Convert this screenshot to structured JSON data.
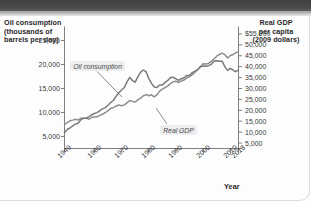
{
  "figure": {
    "left_axis_title": "Oil consumption (thousands of barrels per day)",
    "right_axis_title": "Real GDP per capita (2009 dollars)",
    "xaxis_title": "Year"
  },
  "chart_data": {
    "type": "line",
    "title": "",
    "xlabel": "Year",
    "grid": false,
    "legend": "inline-annotations",
    "x": [
      1949,
      1950,
      1951,
      1952,
      1953,
      1954,
      1955,
      1956,
      1957,
      1958,
      1959,
      1960,
      1961,
      1962,
      1963,
      1964,
      1965,
      1966,
      1967,
      1968,
      1969,
      1970,
      1971,
      1972,
      1973,
      1974,
      1975,
      1976,
      1977,
      1978,
      1979,
      1980,
      1981,
      1982,
      1983,
      1984,
      1985,
      1986,
      1987,
      1988,
      1989,
      1990,
      1991,
      1992,
      1993,
      1994,
      1995,
      1996,
      1997,
      1998,
      1999,
      2000,
      2001,
      2002,
      2003,
      2004,
      2005,
      2006,
      2007,
      2008,
      2009,
      2010,
      2011,
      2012,
      2013
    ],
    "xticks": [
      "1949",
      "1960",
      "1970",
      "1980",
      "1990",
      "2000",
      "2010",
      "2013"
    ],
    "xtick_values": [
      1949,
      1960,
      1970,
      1980,
      1990,
      2000,
      2010,
      2013
    ],
    "axes": [
      {
        "id": "left",
        "side": "left",
        "label": "Oil consumption (thousands of barrels per day)",
        "ticks": [
          "25,000",
          "20,000",
          "15,000",
          "10,000",
          "5,000"
        ],
        "tick_values": [
          25000,
          20000,
          15000,
          10000,
          5000
        ],
        "ylim": [
          2500,
          27500
        ]
      },
      {
        "id": "right",
        "side": "right",
        "label": "Real GDP per capita (2009 dollars)",
        "ticks": [
          "$55,000",
          "50,000",
          "45,000",
          "40,000",
          "35,000",
          "30,000",
          "25,000",
          "20,000",
          "15,000",
          "10,000",
          "5,000"
        ],
        "tick_values": [
          55000,
          50000,
          45000,
          40000,
          35000,
          30000,
          25000,
          20000,
          15000,
          10000,
          5000
        ],
        "ylim": [
          2500,
          57500
        ]
      }
    ],
    "series": [
      {
        "name": "Oil consumption",
        "axis": "left",
        "units": "thousands of barrels per day",
        "color": "#7a7a7c",
        "annotation": "Oil consumption",
        "values": [
          5770,
          6458,
          6765,
          7200,
          7570,
          7760,
          8460,
          8780,
          8800,
          9120,
          9530,
          9800,
          9980,
          10400,
          10740,
          11020,
          11510,
          12080,
          12560,
          13390,
          14140,
          14700,
          15210,
          16370,
          17310,
          16650,
          16320,
          17460,
          18430,
          18850,
          18510,
          17060,
          16060,
          15300,
          15230,
          15730,
          15730,
          16280,
          16670,
          17280,
          17330,
          16990,
          16710,
          17030,
          17240,
          17720,
          17720,
          18310,
          18620,
          18920,
          19520,
          19700,
          19650,
          19760,
          20030,
          20730,
          20800,
          20690,
          20680,
          19500,
          18770,
          19180,
          18840,
          18490,
          18890
        ]
      },
      {
        "name": "Real GDP",
        "axis": "right",
        "units": "2009 dollars per capita",
        "color": "#8d8d8f",
        "annotation": "Real GDP",
        "values": [
          13500,
          14400,
          15200,
          15500,
          15900,
          15500,
          16400,
          16400,
          16400,
          15900,
          16800,
          16900,
          17000,
          17700,
          18200,
          18900,
          19900,
          20900,
          21200,
          22000,
          22400,
          22100,
          22500,
          23400,
          24500,
          24100,
          23800,
          24800,
          25600,
          26700,
          27200,
          26700,
          27100,
          26200,
          27100,
          28800,
          29700,
          30400,
          31200,
          32200,
          33100,
          33300,
          32800,
          33400,
          33900,
          34900,
          35400,
          36300,
          37500,
          38700,
          40000,
          41300,
          41200,
          41500,
          42400,
          43600,
          44800,
          45600,
          46200,
          45500,
          44000,
          45100,
          45600,
          46300,
          46900
        ]
      }
    ]
  }
}
